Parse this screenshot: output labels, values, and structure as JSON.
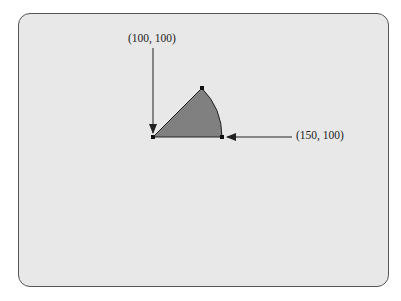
{
  "figure": {
    "labels": {
      "top_point": "(100, 100)",
      "right_point": "(150, 100)"
    },
    "colors": {
      "panel_bg": "#e8e8e8",
      "sector_fill": "#808080",
      "stroke": "#222222"
    },
    "shape": "pie-sector",
    "sector": {
      "center_px": [
        153,
        137
      ],
      "radius_px": 69,
      "start_angle_deg": 0,
      "end_angle_deg": 45
    }
  }
}
